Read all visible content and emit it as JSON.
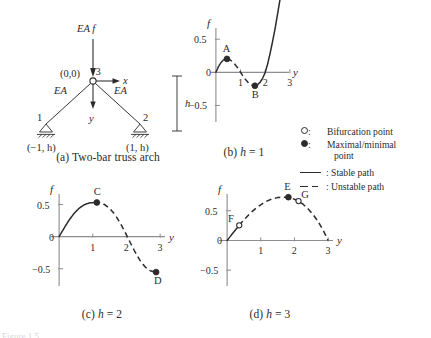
{
  "figure": {
    "footnote": "Figure 1.5",
    "panel_a": {
      "caption_label": "(a)",
      "caption_text": "Two-bar truss arch",
      "load_label": "EA f",
      "origin_label": "(0,0)",
      "node3_label": "3",
      "node1_label": "1",
      "node2_label": "2",
      "node1_coord": "(−1, h)",
      "node2_coord": "(1, h)",
      "bar_left_label": "EA",
      "bar_right_label": "EA",
      "axis_x_label": "x",
      "axis_y_label": "y",
      "height_label": "h"
    },
    "legend": {
      "items": [
        {
          "mark": "open-circle-icon",
          "colon": ":",
          "text": "Bifurcation point",
          "indent": ""
        },
        {
          "mark": "filled-circle-icon",
          "colon": ":",
          "text": "Maximal/minimal",
          "indent": "point"
        },
        {
          "mark": "solid-line-icon",
          "colon": ":",
          "text": "Stable path",
          "indent": ""
        },
        {
          "mark": "dashed-line-icon",
          "colon": ":",
          "text": "Unstable path",
          "indent": ""
        }
      ]
    }
  },
  "chart_data": [
    {
      "id": "panel-b",
      "type": "line",
      "title": "(b) h = 1",
      "caption_label": "(b)",
      "caption_var": "h",
      "caption_value": "= 1",
      "xlabel": "y",
      "ylabel": "f",
      "xlim": [
        -0.28,
        3.45
      ],
      "ylim": [
        -0.78,
        0.82
      ],
      "xticks": [
        1,
        2,
        3
      ],
      "xtick_labels": [
        "1",
        "2",
        "3"
      ],
      "yticks": [
        -0.5,
        0,
        0.5
      ],
      "ytick_labels": [
        "−0.5",
        "0",
        "0.5"
      ],
      "grid": false,
      "x": [
        0.0,
        0.1,
        0.2,
        0.3,
        0.4,
        0.5,
        0.6,
        0.7,
        0.8,
        0.9,
        1.0,
        1.1,
        1.2,
        1.3,
        1.4,
        1.5,
        1.6,
        1.7,
        1.8,
        1.9,
        2.0,
        2.1,
        2.2,
        2.3,
        2.4,
        2.5,
        2.6,
        2.7
      ],
      "y": [
        0.0,
        0.085,
        0.145,
        0.185,
        0.203,
        0.2,
        0.182,
        0.15,
        0.108,
        0.057,
        0.0,
        -0.057,
        -0.108,
        -0.15,
        -0.182,
        -0.2,
        -0.203,
        -0.185,
        -0.145,
        -0.085,
        0.0,
        0.13,
        0.29,
        0.47,
        0.66,
        0.88,
        1.1,
        1.36
      ],
      "stable_segments": [
        [
          0.0,
          0.45
        ],
        [
          1.62,
          2.7
        ]
      ],
      "unstable_segments": [
        [
          0.45,
          1.62
        ]
      ],
      "points": [
        {
          "label": "A",
          "x": 0.45,
          "y": 0.203,
          "kind": "filled",
          "label_dx": -1,
          "label_dy": -7
        },
        {
          "label": "B",
          "x": 1.58,
          "y": -0.203,
          "kind": "filled",
          "label_dx": 0,
          "label_dy": 12
        }
      ]
    },
    {
      "id": "panel-c",
      "type": "line",
      "title": "(c) h = 2",
      "caption_label": "(c)",
      "caption_var": "h",
      "caption_value": "= 2",
      "xlabel": "y",
      "ylabel": "f",
      "xlim": [
        -0.3,
        3.5
      ],
      "ylim": [
        -0.8,
        0.82
      ],
      "xticks": [
        1,
        2,
        3
      ],
      "xtick_labels": [
        "1",
        "2",
        "3"
      ],
      "yticks": [
        -0.5,
        0,
        0.5
      ],
      "ytick_labels": [
        "−0.5",
        "0",
        "0.5"
      ],
      "grid": false,
      "x": [
        0.0,
        0.15,
        0.3,
        0.45,
        0.6,
        0.75,
        0.9,
        1.05,
        1.2,
        1.35,
        1.5,
        1.65,
        1.8,
        1.95,
        2.1,
        2.25,
        2.4,
        2.55,
        2.7,
        2.85
      ],
      "y": [
        0.0,
        0.135,
        0.26,
        0.365,
        0.445,
        0.498,
        0.525,
        0.532,
        0.528,
        0.5,
        0.44,
        0.35,
        0.225,
        0.08,
        -0.08,
        -0.235,
        -0.37,
        -0.47,
        -0.53,
        -0.552
      ],
      "stable_segments": [
        [
          0.0,
          1.05
        ]
      ],
      "unstable_segments": [
        [
          1.05,
          2.85
        ]
      ],
      "points": [
        {
          "label": "C",
          "x": 1.12,
          "y": 0.532,
          "kind": "filled",
          "label_dx": 0,
          "label_dy": -7
        },
        {
          "label": "D",
          "x": 2.88,
          "y": -0.552,
          "kind": "filled",
          "label_dx": 1,
          "label_dy": 12
        }
      ]
    },
    {
      "id": "panel-d",
      "type": "line",
      "title": "(d) h = 3",
      "caption_label": "(d)",
      "caption_var": "h",
      "caption_value": "= 3",
      "xlabel": "y",
      "ylabel": "f",
      "xlim": [
        -0.3,
        3.5
      ],
      "ylim": [
        -0.8,
        0.95
      ],
      "xticks": [
        1,
        2,
        3
      ],
      "xtick_labels": [
        "1",
        "2",
        "3"
      ],
      "yticks": [
        -0.5,
        0,
        0.5
      ],
      "ytick_labels": [
        "−0.5",
        "0",
        "0.5"
      ],
      "grid": false,
      "x": [
        0.0,
        0.15,
        0.3,
        0.45,
        0.6,
        0.75,
        0.9,
        1.05,
        1.2,
        1.35,
        1.5,
        1.65,
        1.8,
        1.95,
        2.1,
        2.25,
        2.4,
        2.55,
        2.7,
        2.85,
        3.0
      ],
      "y": [
        0.0,
        0.108,
        0.215,
        0.315,
        0.408,
        0.49,
        0.562,
        0.62,
        0.668,
        0.702,
        0.722,
        0.73,
        0.725,
        0.705,
        0.668,
        0.612,
        0.535,
        0.438,
        0.32,
        0.175,
        0.0
      ],
      "stable_segments": [
        [
          0.0,
          0.36
        ]
      ],
      "unstable_segments": [
        [
          0.36,
          3.0
        ]
      ],
      "points": [
        {
          "label": "F",
          "x": 0.36,
          "y": 0.255,
          "kind": "open",
          "label_dx": -8,
          "label_dy": -3
        },
        {
          "label": "E",
          "x": 1.82,
          "y": 0.728,
          "kind": "filled",
          "label_dx": -1,
          "label_dy": -7
        },
        {
          "label": "G",
          "x": 2.12,
          "y": 0.662,
          "kind": "open",
          "label_dx": 6,
          "label_dy": -3
        }
      ]
    }
  ]
}
